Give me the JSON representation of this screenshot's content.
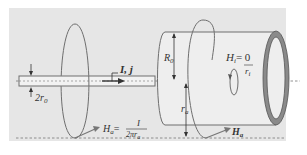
{
  "figure": {
    "background_color": "#e6e6e6",
    "stroke_color": "#6e6e6e",
    "wire_fill": "#f2f2f2",
    "cylinder_fill": "#eeeeee",
    "shell_ring_fill": "#8a8a8a",
    "labels": {
      "current": "I, j",
      "wire_diameter": "2r",
      "wire_diameter_sub": "0",
      "outer_radius": "R",
      "outer_radius_sub": "0",
      "inner_field": "H",
      "inner_field_sub": "i",
      "inner_field_eq": "= 0",
      "inner_radius": "r",
      "inner_radius_sub": "i",
      "shell_radius": "r",
      "shell_radius_sub": "a",
      "field_a": "H",
      "field_a_sub": "a",
      "field_a_eq": "=",
      "field_a_num": "I",
      "field_a_den": "2πr",
      "field_a_den_sub": "a",
      "field_a_right": "H",
      "field_a_right_sub": "a"
    }
  }
}
